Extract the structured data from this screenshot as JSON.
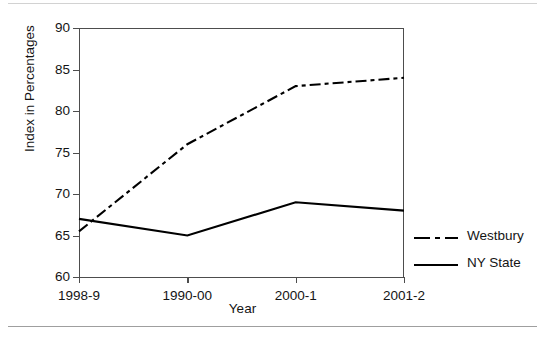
{
  "chart_data": {
    "type": "line",
    "title": "",
    "xlabel": "Year",
    "ylabel": "Index in Percentages",
    "categories": [
      "1998-9",
      "1990-00",
      "2000-1",
      "2001-2"
    ],
    "ylim": [
      60,
      90
    ],
    "yticks": [
      60,
      65,
      70,
      75,
      80,
      85,
      90
    ],
    "ytick_labels": [
      "60",
      "65",
      "70",
      "75",
      "80",
      "85",
      "90"
    ],
    "grid": false,
    "legend_position": "right-outside-bottom",
    "series": [
      {
        "name": "Westbury",
        "values": [
          65.5,
          76,
          83,
          84
        ],
        "linestyle": "dash-dot",
        "color": "#000000"
      },
      {
        "name": "NY State",
        "values": [
          67,
          65,
          69,
          68
        ],
        "linestyle": "solid",
        "color": "#000000"
      }
    ]
  },
  "legend": {
    "entries": [
      {
        "label": "Westbury",
        "style": "dash-dot"
      },
      {
        "label": "NY State",
        "style": "solid"
      }
    ]
  },
  "colors": {
    "axis": "#4d4d4d",
    "series": "#000000",
    "text": "#141414",
    "page_rule": "#bdbdbd",
    "background": "#ffffff"
  }
}
